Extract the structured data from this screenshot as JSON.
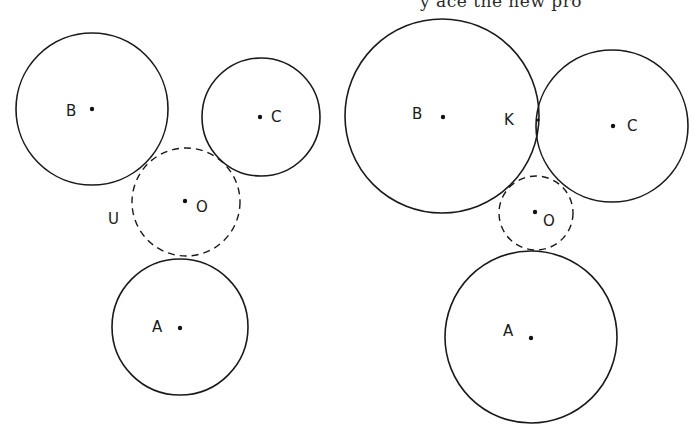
{
  "header_text": {
    "clipped_line": "y  ace  the new pro"
  },
  "figures": {
    "left": {
      "description": "Three mutually separated circles A, B, C with dashed circle O tangent to all three",
      "circles": [
        {
          "id": "B",
          "label": "B",
          "cx": 92,
          "cy": 109,
          "r": 76,
          "style": "solid",
          "label_x": 66,
          "label_y": 116
        },
        {
          "id": "C",
          "label": "C",
          "cx": 261,
          "cy": 117,
          "r": 59,
          "style": "solid",
          "label_x": 271,
          "label_y": 122
        },
        {
          "id": "O",
          "label": "O",
          "cx": 186,
          "cy": 202,
          "r": 54,
          "style": "dashed",
          "label_x": 196,
          "label_y": 212
        },
        {
          "id": "A",
          "label": "A",
          "cx": 180,
          "cy": 327,
          "r": 68,
          "style": "solid",
          "label_x": 152,
          "label_y": 332
        }
      ],
      "extra_labels": [
        {
          "id": "U",
          "label": "U",
          "x": 108,
          "y": 224
        }
      ]
    },
    "right": {
      "description": "Circles B and C tangent at K, with dashed circle O tangent to A, B, C",
      "circles": [
        {
          "id": "B",
          "label": "B",
          "cx": 442,
          "cy": 116,
          "r": 97,
          "style": "solid",
          "label_x": 412,
          "label_y": 119
        },
        {
          "id": "C",
          "label": "C",
          "cx": 612,
          "cy": 126,
          "r": 76,
          "style": "solid",
          "label_x": 627,
          "label_y": 131
        },
        {
          "id": "O",
          "label": "O",
          "cx": 536,
          "cy": 213,
          "r": 37,
          "style": "dashed",
          "label_x": 543,
          "label_y": 226
        },
        {
          "id": "A",
          "label": "A",
          "cx": 531,
          "cy": 337,
          "r": 86,
          "style": "solid",
          "label_x": 503,
          "label_y": 336
        }
      ],
      "extra_labels": [
        {
          "id": "K",
          "label": "K",
          "x": 504,
          "y": 125
        }
      ],
      "tangent_point": {
        "label": "K",
        "x": 538,
        "y": 120
      }
    }
  },
  "colors": {
    "stroke": "#1a1a1a",
    "background": "#ffffff"
  }
}
